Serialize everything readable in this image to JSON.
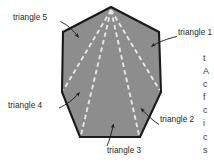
{
  "figure": {
    "name": "heptagon-triangulation-diagram",
    "shape": "regular heptagon divided into 5 triangles",
    "fill_color": "#8d8d8d",
    "outline_color": "#1a1a1a",
    "dashed_line_color": "#e8e8e8",
    "background_color": "#ffffff",
    "arrow_color": "#231f20",
    "label_color": "#231f20",
    "polygon_points": "111,7 159,32 161,92 140,137 80,137 62,92 63,32",
    "apex": {
      "x": 111,
      "y": 7
    },
    "diagonals": [
      {
        "name": "apex-to-vertex-right-mid",
        "x1": 111,
        "y1": 9,
        "x2": 161,
        "y2": 92
      },
      {
        "name": "apex-to-vertex-bottom-right",
        "x1": 111,
        "y1": 9,
        "x2": 140,
        "y2": 137
      },
      {
        "name": "apex-to-vertex-bottom-left",
        "x1": 111,
        "y1": 9,
        "x2": 80,
        "y2": 137
      },
      {
        "name": "apex-to-vertex-left-mid",
        "x1": 111,
        "y1": 9,
        "x2": 62,
        "y2": 92
      }
    ],
    "labels": [
      {
        "id": "t5",
        "text": "triangle 5",
        "leader": "M62,22 L78,38"
      },
      {
        "id": "t1",
        "text": "triangle 1",
        "leader": "M176,38 L150,48"
      },
      {
        "id": "t4",
        "text": "triangle 4",
        "leader": "M60,108 L80,92"
      },
      {
        "id": "t2",
        "text": "triangle 2",
        "leader": "M158,124 L140,108"
      },
      {
        "id": "t3",
        "text": "triangle 3",
        "leader": "M108,146 L114,124"
      }
    ],
    "side_text_fragment": [
      "t",
      "A",
      "c",
      "f",
      "c",
      "i",
      "c",
      "s"
    ]
  }
}
